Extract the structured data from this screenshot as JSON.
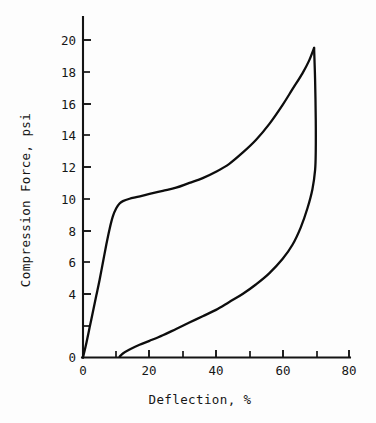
{
  "chart_data": {
    "type": "line",
    "title": "",
    "xlabel": "Deflection, %",
    "ylabel": "Compression Force, psi",
    "xlim": [
      0,
      82
    ],
    "ylim": [
      0,
      21.5
    ],
    "xticks": [
      0,
      10,
      20,
      30,
      40,
      50,
      60,
      70,
      80
    ],
    "yticks": [
      0,
      2,
      4,
      6,
      8,
      10,
      12,
      14,
      16,
      18,
      20
    ],
    "xtick_labels": [
      "0",
      "",
      "20",
      "",
      "40",
      "",
      "60",
      "",
      "80"
    ],
    "ytick_labels": [
      "0",
      "",
      "4",
      "",
      "8",
      "",
      "12",
      "",
      "16",
      "",
      "20"
    ],
    "ytick_labels_all": [
      "0",
      "2",
      "4",
      "6",
      "8",
      "10",
      "12",
      "14",
      "16",
      "18",
      "20"
    ],
    "grid": false,
    "legend": "none",
    "series": [
      {
        "name": "loading",
        "points": [
          [
            0.0,
            0.0
          ],
          [
            1.0,
            0.9
          ],
          [
            2.0,
            1.9
          ],
          [
            3.0,
            2.9
          ],
          [
            4.0,
            3.9
          ],
          [
            5.0,
            4.9
          ],
          [
            6.0,
            6.0
          ],
          [
            7.0,
            7.1
          ],
          [
            8.0,
            8.1
          ],
          [
            9.0,
            8.9
          ],
          [
            10.0,
            9.4
          ],
          [
            11.0,
            9.7
          ],
          [
            12.0,
            9.85
          ],
          [
            14.0,
            10.0
          ],
          [
            16.0,
            10.1
          ],
          [
            18.0,
            10.2
          ],
          [
            20.0,
            10.3
          ],
          [
            24.0,
            10.5
          ],
          [
            28.0,
            10.7
          ],
          [
            32.0,
            11.0
          ],
          [
            36.0,
            11.3
          ],
          [
            40.0,
            11.7
          ],
          [
            44.0,
            12.2
          ],
          [
            48.0,
            12.9
          ],
          [
            52.0,
            13.7
          ],
          [
            56.0,
            14.7
          ],
          [
            60.0,
            15.9
          ],
          [
            63.0,
            16.9
          ],
          [
            66.0,
            17.9
          ],
          [
            68.0,
            18.7
          ],
          [
            69.5,
            19.5
          ]
        ]
      },
      {
        "name": "unloading",
        "points": [
          [
            69.5,
            19.5
          ],
          [
            69.8,
            17.5
          ],
          [
            70.0,
            15.0
          ],
          [
            70.0,
            13.0
          ],
          [
            69.8,
            11.8
          ],
          [
            69.0,
            10.6
          ],
          [
            67.5,
            9.4
          ],
          [
            65.5,
            8.2
          ],
          [
            63.0,
            7.1
          ],
          [
            60.0,
            6.2
          ],
          [
            56.0,
            5.3
          ],
          [
            52.0,
            4.6
          ],
          [
            48.0,
            4.0
          ],
          [
            44.0,
            3.5
          ],
          [
            40.0,
            3.0
          ],
          [
            36.0,
            2.6
          ],
          [
            32.0,
            2.2
          ],
          [
            28.0,
            1.8
          ],
          [
            24.0,
            1.4
          ],
          [
            20.0,
            1.05
          ],
          [
            17.0,
            0.8
          ],
          [
            14.0,
            0.5
          ],
          [
            12.0,
            0.25
          ],
          [
            11.0,
            0.05
          ]
        ]
      }
    ]
  },
  "annotations": {
    "axis_color": "#141414",
    "curve_color": "#0d0d0d",
    "background": "#fdfdfd"
  }
}
